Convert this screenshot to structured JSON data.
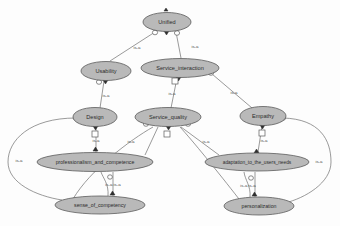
{
  "diagram": {
    "type": "ontology-graph",
    "background_color": "#fdfdfd",
    "node_fill_color": "#b9b9b9",
    "node_stroke_color": "#5a5a5a",
    "edge_color": "#6f6f6f",
    "relation_label": "is-a",
    "relation_label_double": "is-a is-a",
    "nodes": [
      {
        "id": "unified",
        "label": "Unified",
        "cx": 167,
        "cy": 22,
        "rx": 24,
        "ry": 9.5,
        "font_size": 5.6
      },
      {
        "id": "usability",
        "label": "Usability",
        "cx": 106,
        "cy": 71,
        "rx": 25,
        "ry": 9.5,
        "font_size": 5.6
      },
      {
        "id": "service_interaction",
        "label": "Service_interaction",
        "cx": 180,
        "cy": 68,
        "rx": 39,
        "ry": 9.5,
        "font_size": 5.6
      },
      {
        "id": "design",
        "label": "Design",
        "cx": 95,
        "cy": 117,
        "rx": 22,
        "ry": 9.5,
        "font_size": 5.6
      },
      {
        "id": "service_quality",
        "label": "Service_quality",
        "cx": 168,
        "cy": 117,
        "rx": 33,
        "ry": 9.5,
        "font_size": 5.6
      },
      {
        "id": "empathy",
        "label": "Empathy",
        "cx": 263,
        "cy": 116,
        "rx": 23,
        "ry": 9.5,
        "font_size": 5.6
      },
      {
        "id": "professionalism",
        "label": "professionalism_and_competence",
        "cx": 95,
        "cy": 162,
        "rx": 58,
        "ry": 9.5,
        "font_size": 5.2
      },
      {
        "id": "adaptation",
        "label": "adaptation_to_the_users_needs",
        "cx": 257,
        "cy": 162,
        "rx": 52,
        "ry": 9.0,
        "font_size": 4.8
      },
      {
        "id": "competency",
        "label": "sense_of_competency",
        "cx": 100,
        "cy": 205,
        "rx": 45,
        "ry": 9.0,
        "font_size": 5.2
      },
      {
        "id": "personalization",
        "label": "personalization",
        "cx": 259,
        "cy": 206,
        "rx": 35,
        "ry": 9.0,
        "font_size": 5.2
      }
    ],
    "edges": [
      {
        "id": "e1",
        "from": "usability",
        "to": "unified",
        "label": "is-a",
        "label_x": 137,
        "label_y": 47
      },
      {
        "id": "e2",
        "from": "service_interaction",
        "to": "unified",
        "label": "is-a",
        "label_x": 195,
        "label_y": 46
      },
      {
        "id": "e3",
        "from": "design",
        "to": "usability",
        "label": "is-a",
        "label_x": 106,
        "label_y": 95
      },
      {
        "id": "e4",
        "from": "service_quality",
        "to": "service_interaction",
        "label": "is-a",
        "label_x": 172,
        "label_y": 93
      },
      {
        "id": "e5",
        "from": "empathy",
        "to": "service_interaction",
        "label": "is-a",
        "label_x": 234,
        "label_y": 92
      },
      {
        "id": "e6",
        "from": "professionalism",
        "to": "design",
        "label": "is-a",
        "label_x": 96,
        "label_y": 140
      },
      {
        "id": "e7",
        "from": "professionalism",
        "to": "service_quality",
        "label": "is-a",
        "label_x": 131,
        "label_y": 141
      },
      {
        "id": "e8",
        "from": "professionalism",
        "to": "design",
        "label": "is-a",
        "label_x": 19,
        "label_y": 160
      },
      {
        "id": "e9",
        "from": "adaptation",
        "to": "service_quality",
        "label": "is-a",
        "label_x": 206,
        "label_y": 141
      },
      {
        "id": "e10",
        "from": "adaptation",
        "to": "empathy",
        "label": "is-a",
        "label_x": 264,
        "label_y": 140
      },
      {
        "id": "e11",
        "from": "adaptation",
        "to": "empathy",
        "label": "is-a",
        "label_x": 319,
        "label_y": 161
      },
      {
        "id": "e12",
        "from": "competency",
        "to": "professionalism",
        "label": "is-a is-a",
        "label_x": 113,
        "label_y": 184
      },
      {
        "id": "e13",
        "from": "personalization",
        "to": "adaptation",
        "label": "is-a is-a",
        "label_x": 248,
        "label_y": 185
      },
      {
        "id": "e14",
        "from": "competency",
        "to": "service_quality",
        "label": "",
        "label_x": 0,
        "label_y": 0
      },
      {
        "id": "e15",
        "from": "personalization",
        "to": "service_quality",
        "label": "",
        "label_x": 0,
        "label_y": 0
      }
    ]
  }
}
